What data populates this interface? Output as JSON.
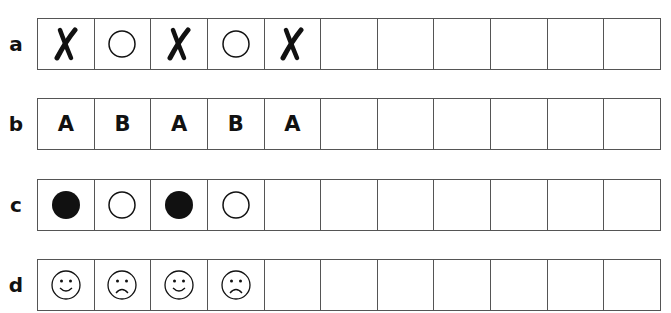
{
  "rows": [
    {
      "label": "a",
      "cells": [
        {
          "type": "cross-icon"
        },
        {
          "type": "circle-outline-icon"
        },
        {
          "type": "cross-icon"
        },
        {
          "type": "circle-outline-icon"
        },
        {
          "type": "cross-icon"
        },
        {
          "type": "empty"
        },
        {
          "type": "empty"
        },
        {
          "type": "empty"
        },
        {
          "type": "empty"
        },
        {
          "type": "empty"
        },
        {
          "type": "empty"
        }
      ]
    },
    {
      "label": "b",
      "cells": [
        {
          "type": "letter",
          "text": "A"
        },
        {
          "type": "letter",
          "text": "B"
        },
        {
          "type": "letter",
          "text": "A"
        },
        {
          "type": "letter",
          "text": "B"
        },
        {
          "type": "letter",
          "text": "A"
        },
        {
          "type": "empty"
        },
        {
          "type": "empty"
        },
        {
          "type": "empty"
        },
        {
          "type": "empty"
        },
        {
          "type": "empty"
        },
        {
          "type": "empty"
        }
      ]
    },
    {
      "label": "c",
      "cells": [
        {
          "type": "circle-filled-icon"
        },
        {
          "type": "circle-outline-icon"
        },
        {
          "type": "circle-filled-icon"
        },
        {
          "type": "circle-outline-icon"
        },
        {
          "type": "empty"
        },
        {
          "type": "empty"
        },
        {
          "type": "empty"
        },
        {
          "type": "empty"
        },
        {
          "type": "empty"
        },
        {
          "type": "empty"
        },
        {
          "type": "empty"
        }
      ]
    },
    {
      "label": "d",
      "cells": [
        {
          "type": "smiley-happy-icon"
        },
        {
          "type": "smiley-sad-icon"
        },
        {
          "type": "smiley-happy-icon"
        },
        {
          "type": "smiley-sad-icon"
        },
        {
          "type": "empty"
        },
        {
          "type": "empty"
        },
        {
          "type": "empty"
        },
        {
          "type": "empty"
        },
        {
          "type": "empty"
        },
        {
          "type": "empty"
        },
        {
          "type": "empty"
        }
      ]
    }
  ],
  "row_tops": [
    18,
    98,
    179,
    259
  ]
}
